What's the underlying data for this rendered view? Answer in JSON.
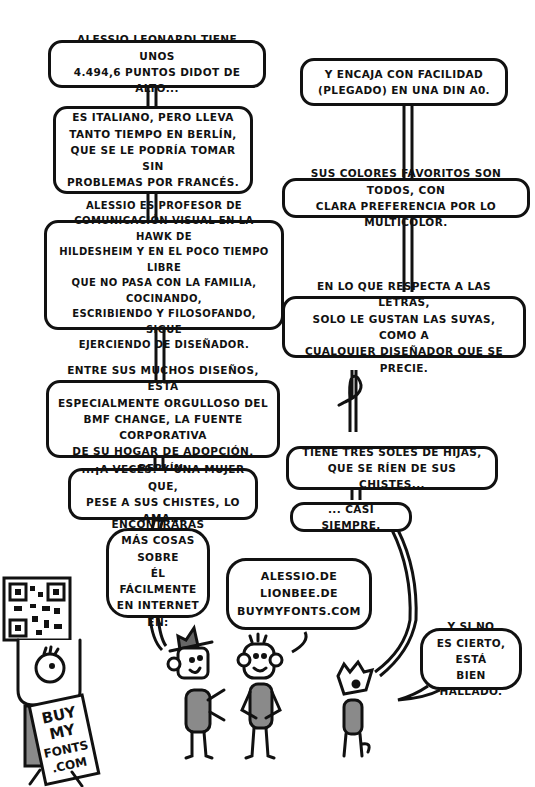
{
  "comic": {
    "left_column": [
      {
        "id": "b1",
        "text": "Alessio Leonardi tiene unos\n4.494,6 puntos didot de alto..."
      },
      {
        "id": "b2",
        "text": "Es italiano, pero lleva\ntanto tiempo en Berlín,\nque se le podría tomar sin\nproblemas por francés."
      },
      {
        "id": "b3",
        "text": "Alessio es profesor de\ncomunicación visual en la HAWK de\nHildesheim y en el poco tiempo libre\nque no pasa con la familia, cocinando,\nescribiendo y filosofando, sigue\nejerciendo de diseñador."
      },
      {
        "id": "b4",
        "text": "Entre sus muchos diseños, está\nespecialmente orgulloso del\nBMF Change, la fuente corporativa\nde su hogar de adopción, Berlín."
      },
      {
        "id": "b5",
        "text": "...¡A veces! Y una mujer que,\npese a sus chistes, lo ama..."
      },
      {
        "id": "b6",
        "text": "Encontrarás\nmás cosas sobre\nél fácilmente\nen internet en:"
      }
    ],
    "right_column": [
      {
        "id": "r1",
        "text": "Y encaja con facilidad\n(plegado) en una DIN A0."
      },
      {
        "id": "r2",
        "text": "Sus colores favoritos son todos, con\nclara preferencia por lo multicolor."
      },
      {
        "id": "r3",
        "text": "En lo que respecta a las letras,\nsolo le gustan las suyas, como a\ncualquier diseñador que se precie."
      },
      {
        "id": "r4",
        "text": "Tiene tres soles de hijas,\nque se ríen de sus chistes..."
      },
      {
        "id": "r5",
        "text": "... casi siempre."
      }
    ],
    "links_bubble": {
      "text": "alessio.de\nlionbee.de\nbuymyfonts.com"
    },
    "dog_bubble": {
      "text": "Y si no\nes cierto, está\nbien hallado."
    },
    "sign_text": [
      "BUY",
      "MY",
      "FONTS",
      ".COM"
    ],
    "colors": {
      "ink": "#111111",
      "gray_fill": "#8a8a8a",
      "background": "#ffffff"
    }
  }
}
